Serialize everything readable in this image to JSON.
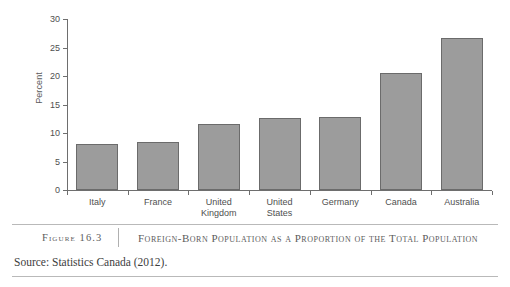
{
  "chart_data": {
    "type": "bar",
    "title": "Foreign-Born Population as a Proportion of the Total Population",
    "xlabel": "",
    "ylabel": "Percent",
    "ylim": [
      0,
      30
    ],
    "yticks": [
      0,
      5,
      10,
      15,
      20,
      25,
      30
    ],
    "ytick_labels": [
      "0",
      "5",
      "10",
      "15",
      "20",
      "25",
      "30"
    ],
    "grid": false,
    "legend": "none",
    "categories": [
      "Italy",
      "France",
      "United Kingdom",
      "United States",
      "Germany",
      "Canada",
      "Australia"
    ],
    "category_lines": [
      [
        "Italy"
      ],
      [
        "France"
      ],
      [
        "United",
        "Kingdom"
      ],
      [
        "United",
        "States"
      ],
      [
        "Germany"
      ],
      [
        "Canada"
      ],
      [
        "Australia"
      ]
    ],
    "values": [
      8.0,
      8.5,
      11.5,
      12.7,
      12.8,
      20.5,
      26.6
    ],
    "bar_color": "#9c9c9c",
    "bar_edge_color": "#6b6b6b",
    "axis_color": "#6e6e6e"
  },
  "figure": {
    "number_label": "Figure 16.3",
    "caption": "Foreign-Born Population as a Proportion of the Total Population",
    "source": "Source: Statistics Canada (2012)."
  }
}
